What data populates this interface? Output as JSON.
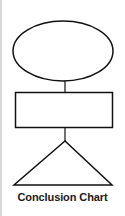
{
  "diagram": {
    "caption": "Conclusion Chart",
    "stroke_color": "#111111",
    "fill_color": "#ffffff",
    "shapes": [
      {
        "type": "ellipse",
        "label": ""
      },
      {
        "type": "connector"
      },
      {
        "type": "rectangle",
        "label": ""
      },
      {
        "type": "connector"
      },
      {
        "type": "triangle",
        "label": ""
      }
    ]
  }
}
